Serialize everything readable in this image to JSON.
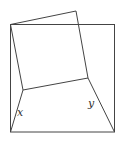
{
  "diagram": {
    "type": "geometry-figure",
    "labels": {
      "x": "x",
      "y": "y"
    },
    "outer_square": {
      "x1": 10,
      "y1": 24,
      "x2": 115,
      "y2": 132
    },
    "tilted_square": [
      [
        10,
        24
      ],
      [
        76,
        11
      ],
      [
        88,
        78
      ],
      [
        23,
        90
      ]
    ],
    "connectors": [
      [
        [
          23,
          90
        ],
        [
          10,
          132
        ]
      ],
      [
        [
          88,
          78
        ],
        [
          115,
          132
        ]
      ]
    ],
    "colors": {
      "stroke": "#444444",
      "label": "#333333",
      "background": "#ffffff"
    }
  }
}
